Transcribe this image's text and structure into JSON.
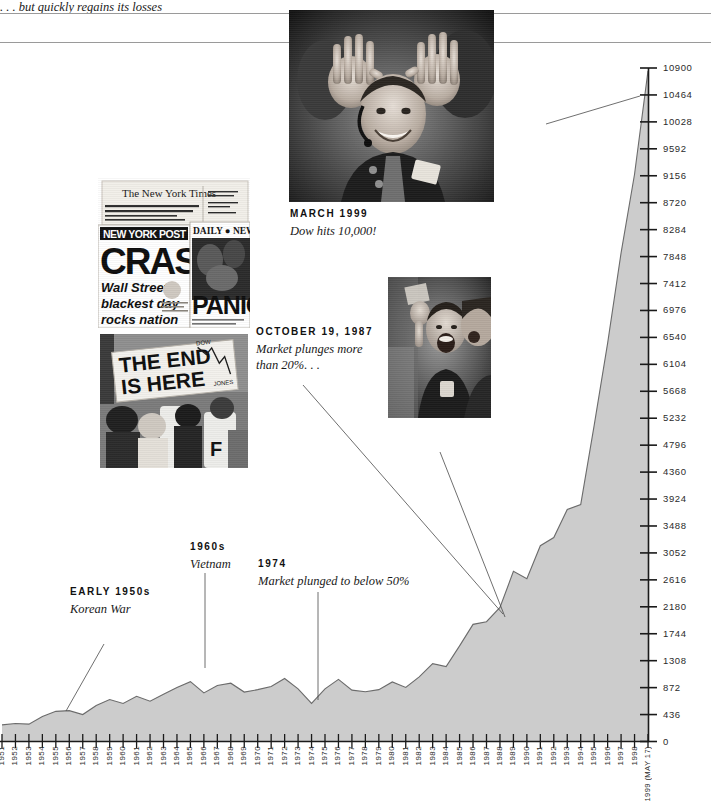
{
  "chart_data": {
    "type": "area",
    "title": "",
    "xlabel": "",
    "ylabel": "",
    "ylim": [
      0,
      10900
    ],
    "grid": false,
    "legend": "none",
    "y_ticks": [
      0,
      436,
      872,
      1308,
      1744,
      2180,
      2616,
      3052,
      3488,
      3924,
      4360,
      4796,
      5232,
      5668,
      6104,
      6540,
      6976,
      7412,
      7848,
      8284,
      8720,
      9156,
      9592,
      10028,
      10464,
      10900
    ],
    "y_tick_labels": [
      "0",
      "436",
      "872",
      "1308",
      "1744",
      "2180",
      "2616",
      "3052",
      "3488",
      "3924",
      "4360",
      "4796",
      "5232",
      "5668",
      "6104",
      "6540",
      "6976",
      "7412",
      "7848",
      "8284",
      "8720",
      "9156",
      "9592",
      "10028",
      "10464",
      "10900"
    ],
    "categories": [
      "1951",
      "1952",
      "1953",
      "1954",
      "1955",
      "1956",
      "1957",
      "1958",
      "1959",
      "1960",
      "1961",
      "1962",
      "1963",
      "1964",
      "1965",
      "1966",
      "1967",
      "1968",
      "1969",
      "1970",
      "1971",
      "1972",
      "1973",
      "1974",
      "1975",
      "1976",
      "1977",
      "1978",
      "1979",
      "1980",
      "1981",
      "1982",
      "1983",
      "1984",
      "1985",
      "1986",
      "1987",
      "1988",
      "1989",
      "1990",
      "1991",
      "1992",
      "1993",
      "1994",
      "1995",
      "1996",
      "1997",
      "1998",
      "1999 (MAY 17)"
    ],
    "values": [
      269,
      292,
      281,
      404,
      488,
      499,
      436,
      584,
      679,
      616,
      731,
      652,
      763,
      874,
      969,
      786,
      905,
      944,
      800,
      839,
      890,
      1020,
      851,
      616,
      852,
      1005,
      831,
      805,
      839,
      964,
      875,
      1047,
      1259,
      1212,
      1547,
      1896,
      1939,
      2169,
      2753,
      2634,
      3169,
      3301,
      3754,
      3834,
      5117,
      6448,
      7908,
      9181,
      10853
    ],
    "series_name": "Dow Jones Industrial Average"
  },
  "y_axis": {
    "labels": [
      "10900",
      "10464",
      "10028",
      "9592",
      "9156",
      "8720",
      "8284",
      "7848",
      "7412",
      "6976",
      "6540",
      "6104",
      "5668",
      "5232",
      "4796",
      "4360",
      "3924",
      "3488",
      "3052",
      "2616",
      "2180",
      "1744",
      "1308",
      "872",
      "436",
      "0"
    ]
  },
  "x_axis": {
    "labels": [
      "1951",
      "1952",
      "1953",
      "1954",
      "1955",
      "1956",
      "1957",
      "1958",
      "1959",
      "1960",
      "1961",
      "1962",
      "1963",
      "1964",
      "1965",
      "1966",
      "1967",
      "1968",
      "1969",
      "1970",
      "1971",
      "1972",
      "1973",
      "1974",
      "1975",
      "1976",
      "1977",
      "1978",
      "1979",
      "1980",
      "1981",
      "1982",
      "1983",
      "1984",
      "1985",
      "1986",
      "1987",
      "1988",
      "1989",
      "1990",
      "1991",
      "1992",
      "1993",
      "1994",
      "1995",
      "1996",
      "1997",
      "1998",
      "1999 (MAY 17)"
    ]
  },
  "annotations": [
    {
      "id": "early-1950s",
      "head": "EARLY 1950s",
      "body": "Korean War"
    },
    {
      "id": "1960s",
      "head": "1960s",
      "body": "Vietnam"
    },
    {
      "id": "1974",
      "head": "1974",
      "body": "Market plunged to below 50%"
    },
    {
      "id": "october-1987",
      "head": "OCTOBER 19, 1987",
      "body": "Market plunges more than 20%. . ."
    },
    {
      "id": "march-1999",
      "head": "MARCH 1999",
      "body": "Dow hits 10,000!"
    }
  ],
  "captions": {
    "regains_losses": ". . . but quickly regains its losses"
  },
  "photos": {
    "trader_1999": {
      "name": "trader-celebrating-dow-10000",
      "alt": "Floor trader raising both hands with ten fingers"
    },
    "traders_cheer": {
      "name": "traders-cheering",
      "alt": "Two traders cheering on the exchange floor"
    },
    "newspapers": {
      "name": "newspaper-crash-headlines",
      "headlines": [
        "The New York Times",
        "NEW YORK POST",
        "CRASH",
        "Wall Street's",
        "blackest day",
        "rocks nation",
        "DAILY NEWS",
        "PANIC"
      ]
    },
    "the_end_sign": {
      "name": "the-end-is-here-protest",
      "sign_text": [
        "THE END",
        "IS HERE"
      ],
      "sign_label": "DOW JONES"
    }
  },
  "colors": {
    "area_fill": "#cccccc",
    "area_stroke": "#6b6b6b",
    "axis": "#1a1a1a",
    "rule": "#9a9a9a",
    "text": "#1a1a1a"
  }
}
